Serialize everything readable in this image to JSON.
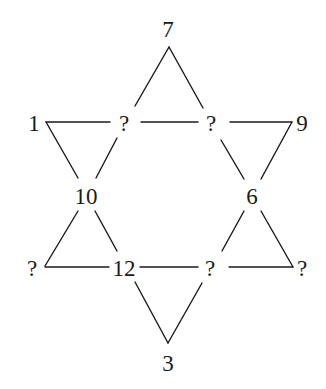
{
  "diagram": {
    "title": "",
    "shape": "six-pointed star (hexagram) number puzzle",
    "nodes": [
      {
        "id": "top",
        "label": "7",
        "x": 168,
        "y": 29
      },
      {
        "id": "upper-left-outer",
        "label": "1",
        "x": 34,
        "y": 123
      },
      {
        "id": "upper-left-inner",
        "label": "?",
        "x": 124,
        "y": 123
      },
      {
        "id": "upper-right-inner",
        "label": "?",
        "x": 211,
        "y": 123
      },
      {
        "id": "upper-right-outer",
        "label": "9",
        "x": 302,
        "y": 123
      },
      {
        "id": "mid-left",
        "label": "10",
        "x": 86,
        "y": 196
      },
      {
        "id": "mid-right",
        "label": "6",
        "x": 252,
        "y": 196
      },
      {
        "id": "lower-left-outer",
        "label": "?",
        "x": 32,
        "y": 268
      },
      {
        "id": "lower-left-inner",
        "label": "12",
        "x": 124,
        "y": 268
      },
      {
        "id": "lower-right-inner",
        "label": "?",
        "x": 210,
        "y": 268
      },
      {
        "id": "lower-right-outer",
        "label": "?",
        "x": 302,
        "y": 268
      },
      {
        "id": "bottom",
        "label": "3",
        "x": 168,
        "y": 363
      }
    ],
    "edges": [
      {
        "from": "top",
        "to": "upper-left-inner"
      },
      {
        "from": "top",
        "to": "upper-right-inner"
      },
      {
        "from": "upper-left-outer",
        "to": "upper-left-inner"
      },
      {
        "from": "upper-left-inner",
        "to": "upper-right-inner"
      },
      {
        "from": "upper-right-inner",
        "to": "upper-right-outer"
      },
      {
        "from": "upper-left-outer",
        "to": "mid-left"
      },
      {
        "from": "upper-left-inner",
        "to": "mid-left"
      },
      {
        "from": "upper-right-inner",
        "to": "mid-right"
      },
      {
        "from": "upper-right-outer",
        "to": "mid-right"
      },
      {
        "from": "mid-left",
        "to": "lower-left-outer"
      },
      {
        "from": "mid-left",
        "to": "lower-left-inner"
      },
      {
        "from": "mid-right",
        "to": "lower-right-inner"
      },
      {
        "from": "mid-right",
        "to": "lower-right-outer"
      },
      {
        "from": "lower-left-outer",
        "to": "lower-left-inner"
      },
      {
        "from": "lower-left-inner",
        "to": "lower-right-inner"
      },
      {
        "from": "lower-right-inner",
        "to": "lower-right-outer"
      },
      {
        "from": "lower-left-inner",
        "to": "bottom"
      },
      {
        "from": "lower-right-inner",
        "to": "bottom"
      }
    ],
    "colors": {
      "line": "#1a1a1a",
      "text": "#1a1a1a",
      "background": "#ffffff"
    }
  }
}
